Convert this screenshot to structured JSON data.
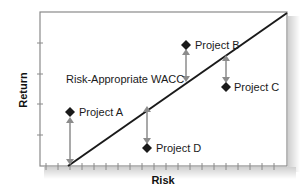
{
  "chart_data": {
    "type": "scatter",
    "title": "",
    "xlabel": "Risk",
    "ylabel": "Return",
    "xlim": [
      0,
      20
    ],
    "ylim": [
      0,
      5
    ],
    "grid": false,
    "legend": null,
    "line": {
      "name": "Risk-Appropriate WACC",
      "x": [
        2.3,
        20
      ],
      "y": [
        0,
        5
      ]
    },
    "series": [
      {
        "name": "Project A",
        "x": 2.4,
        "y": 1.75,
        "line_y": 0.05,
        "position": "above line"
      },
      {
        "name": "Project B",
        "x": 11.8,
        "y": 3.95,
        "line_y": 2.75,
        "position": "above line"
      },
      {
        "name": "Project C",
        "x": 15.0,
        "y": 2.6,
        "line_y": 3.65,
        "position": "below line"
      },
      {
        "name": "Project D",
        "x": 8.7,
        "y": 0.6,
        "line_y": 1.95,
        "position": "below line"
      }
    ],
    "annotations": [
      "Risk-Appropriate WACC",
      "Project A",
      "Project B",
      "Project C",
      "Project D"
    ]
  },
  "labels": {
    "wacc": "Risk-Appropriate WACC",
    "project_a": "Project A",
    "project_b": "Project B",
    "project_c": "Project C",
    "project_d": "Project D",
    "x_axis": "Risk",
    "y_axis": "Return"
  },
  "colors": {
    "frame": "#8a8a8a",
    "line": "#1a1a1a",
    "diamond": "#1a1a1a",
    "arrow": "#8c8c8c",
    "shadow": "#d0d0d0"
  }
}
